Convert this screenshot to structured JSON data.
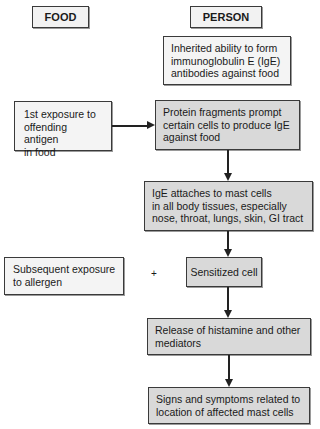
{
  "headers": {
    "food": "FOOD",
    "person": "PERSON"
  },
  "nodes": {
    "inherited": "Inherited ability to form\nimmunoglobulin E (IgE)\nantibodies against food",
    "first_exposure": "1st exposure to\noffending antigen\nin food",
    "protein_fragments": "Protein fragments prompt\ncertain cells to produce IgE\nagainst food",
    "ige_attaches": "IgE attaches to mast cells\nin all body tissues, especially\nnose, throat, lungs, skin, GI tract",
    "subsequent_exposure": "Subsequent exposure\nto allergen",
    "plus": "+",
    "sensitized_cell": "Sensitized cell",
    "release": "Release of histamine and other\nmediators",
    "signs": "Signs and symptoms related to\nlocation of affected mast cells"
  },
  "colors": {
    "light_box": "#f4f4f4",
    "gray_box": "#d9d9d9",
    "border": "#3a3a3a"
  }
}
